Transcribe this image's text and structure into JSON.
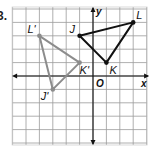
{
  "problem_number": "3.",
  "graph": {
    "x_axis_label": "x",
    "y_axis_label": "y",
    "origin_label": "O",
    "grid": {
      "x_min": -6,
      "x_max": 4,
      "y_min": -5,
      "y_max": 5
    },
    "colors": {
      "original": "#111111",
      "image": "#8c8c8c",
      "grid": "#9a9a9a",
      "axis": "#111111"
    }
  },
  "triangles": {
    "original": {
      "vertices": [
        {
          "label": "J",
          "x": -1,
          "y": 3
        },
        {
          "label": "K",
          "x": 1,
          "y": 1
        },
        {
          "label": "L",
          "x": 3,
          "y": 4
        }
      ]
    },
    "image": {
      "vertices": [
        {
          "label": "J'",
          "x": -3,
          "y": -1
        },
        {
          "label": "K'",
          "x": -1,
          "y": 1
        },
        {
          "label": "L'",
          "x": -4,
          "y": 3
        }
      ]
    }
  }
}
